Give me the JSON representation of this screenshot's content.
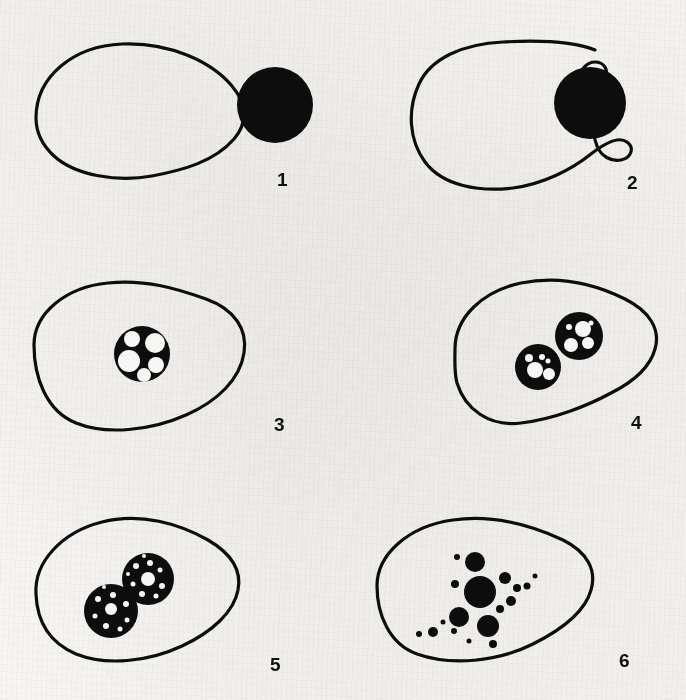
{
  "figure": {
    "medium": "scanned book page, black line art on off-white paper",
    "background_color": "#f7f6f4",
    "ink_color": "#0d0d0d",
    "width": 686,
    "height": 700,
    "layout": "2 columns x 3 rows of numbered panels"
  },
  "panels": [
    {
      "number": "1",
      "name": "panel-1-contact",
      "number_x": 277,
      "number_y": 170,
      "cell_path": "M 36 118 C 36 76, 74 46, 122 44 C 170 42, 212 62, 232 86 C 248 105, 247 124, 234 139 C 214 162, 183 170, 152 176 C 118 182, 76 176, 54 156 C 40 143, 36 131, 36 118 Z",
      "particles": [
        {
          "cx": 275,
          "cy": 105,
          "r": 38
        }
      ],
      "vacuoles": [],
      "granules": []
    },
    {
      "number": "2",
      "name": "panel-2-pseudopodia-engulfing",
      "number_x": 284,
      "number_y": 173,
      "cell_path": "M 252 50 C 232 42, 196 40, 160 42 C 120 44, 88 58, 76 84 C 64 110, 66 140, 82 162 C 100 186, 136 192, 170 188 C 200 184, 228 170, 248 154 C 262 143, 276 136, 284 142 C 292 148, 288 158, 278 160 C 268 162, 258 156, 254 146 C 248 132, 252 118, 258 110 C 244 102, 236 92, 236 80 C 236 70, 244 62, 252 62 C 261 62, 266 70, 262 77 C 259 83, 252 84, 247 80",
      "particles": [
        {
          "cx": 247,
          "cy": 103,
          "r": 36
        }
      ],
      "vacuoles": [],
      "granules": []
    },
    {
      "number": "3",
      "name": "panel-3-phagosome-formed",
      "number_x": 274,
      "number_y": 182,
      "cell_path": "M 34 112 C 34 80, 66 54, 108 50 C 146 46, 178 56, 206 66 C 234 76, 248 96, 244 120 C 240 146, 218 168, 186 182 C 150 198, 106 202, 76 190 C 46 178, 34 144, 34 112 Z",
      "vacuoles": [
        {
          "cx": 142,
          "cy": 121,
          "r": 28,
          "vesicles": [
            {
              "cx": 132,
              "cy": 106,
              "r": 8
            },
            {
              "cx": 155,
              "cy": 110,
              "r": 10
            },
            {
              "cx": 129,
              "cy": 128,
              "r": 11
            },
            {
              "cx": 156,
              "cy": 132,
              "r": 8
            },
            {
              "cx": 144,
              "cy": 142,
              "r": 7
            }
          ]
        }
      ],
      "particles": [],
      "granules": []
    },
    {
      "number": "4",
      "name": "panel-4-two-phagosomes",
      "number_x": 288,
      "number_y": 180,
      "cell_path": "M 112 116 C 112 84, 140 58, 178 50 C 218 42, 254 52, 282 66 C 306 78, 318 96, 312 116 C 306 138, 284 152, 268 160 C 246 172, 212 186, 178 190 C 146 194, 122 176, 114 150 C 111 139, 112 127, 112 116 Z",
      "vacuoles": [
        {
          "cx": 236,
          "cy": 103,
          "r": 24,
          "vesicles": [
            {
              "cx": 240,
              "cy": 96,
              "r": 8
            },
            {
              "cx": 245,
              "cy": 110,
              "r": 6
            },
            {
              "cx": 228,
              "cy": 112,
              "r": 7
            },
            {
              "cx": 226,
              "cy": 94,
              "r": 3
            },
            {
              "cx": 248,
              "cy": 90,
              "r": 2.5
            }
          ]
        },
        {
          "cx": 195,
          "cy": 134,
          "r": 23,
          "vesicles": [
            {
              "cx": 192,
              "cy": 137,
              "r": 8
            },
            {
              "cx": 206,
              "cy": 141,
              "r": 6
            },
            {
              "cx": 186,
              "cy": 125,
              "r": 4
            },
            {
              "cx": 199,
              "cy": 124,
              "r": 3
            },
            {
              "cx": 205,
              "cy": 128,
              "r": 2.5
            }
          ]
        }
      ],
      "particles": [],
      "granules": []
    },
    {
      "number": "5",
      "name": "panel-5-digestion-speckled",
      "number_x": 270,
      "number_y": 189,
      "cell_path": "M 36 128 C 34 96, 62 66, 102 56 C 140 46, 180 58, 208 74 C 232 88, 242 104, 238 124 C 234 146, 212 166, 182 180 C 148 196, 106 200, 76 188 C 48 176, 37 154, 36 128 Z",
      "vacuoles": [
        {
          "cx": 148,
          "cy": 113,
          "r": 26,
          "speckled": true,
          "vesicles": [
            {
              "cx": 148,
              "cy": 113,
              "r": 7
            },
            {
              "cx": 136,
              "cy": 100,
              "r": 3
            },
            {
              "cx": 150,
              "cy": 97,
              "r": 3
            },
            {
              "cx": 160,
              "cy": 104,
              "r": 2.5
            },
            {
              "cx": 133,
              "cy": 118,
              "r": 2.5
            },
            {
              "cx": 162,
              "cy": 120,
              "r": 3
            },
            {
              "cx": 142,
              "cy": 128,
              "r": 3
            },
            {
              "cx": 156,
              "cy": 130,
              "r": 2.5
            },
            {
              "cx": 144,
              "cy": 90,
              "r": 2
            },
            {
              "cx": 128,
              "cy": 108,
              "r": 2
            }
          ]
        },
        {
          "cx": 111,
          "cy": 145,
          "r": 27,
          "speckled": true,
          "vesicles": [
            {
              "cx": 111,
              "cy": 143,
              "r": 6
            },
            {
              "cx": 98,
              "cy": 133,
              "r": 3
            },
            {
              "cx": 113,
              "cy": 129,
              "r": 3
            },
            {
              "cx": 126,
              "cy": 138,
              "r": 3
            },
            {
              "cx": 95,
              "cy": 150,
              "r": 2.5
            },
            {
              "cx": 127,
              "cy": 154,
              "r": 2.5
            },
            {
              "cx": 106,
              "cy": 160,
              "r": 3
            },
            {
              "cx": 120,
              "cy": 163,
              "r": 2.5
            },
            {
              "cx": 104,
              "cy": 121,
              "r": 2
            }
          ]
        }
      ],
      "particles": [],
      "granules": []
    },
    {
      "number": "6",
      "name": "panel-6-residual-granules",
      "number_x": 276,
      "number_y": 185,
      "cell_path": "M 34 120 C 34 88, 66 60, 110 54 C 152 48, 190 60, 220 74 C 244 86, 254 104, 248 124 C 242 146, 218 164, 190 178 C 154 196, 108 200, 74 188 C 46 178, 34 148, 34 120 Z",
      "vacuoles": [],
      "particles": [],
      "granules": [
        {
          "cx": 137,
          "cy": 126,
          "r": 16
        },
        {
          "cx": 132,
          "cy": 96,
          "r": 10
        },
        {
          "cx": 114,
          "cy": 91,
          "r": 3
        },
        {
          "cx": 116,
          "cy": 151,
          "r": 10
        },
        {
          "cx": 145,
          "cy": 160,
          "r": 11
        },
        {
          "cx": 162,
          "cy": 112,
          "r": 6
        },
        {
          "cx": 174,
          "cy": 122,
          "r": 4
        },
        {
          "cx": 184,
          "cy": 120,
          "r": 3.5
        },
        {
          "cx": 168,
          "cy": 135,
          "r": 5
        },
        {
          "cx": 112,
          "cy": 118,
          "r": 4
        },
        {
          "cx": 157,
          "cy": 143,
          "r": 4
        },
        {
          "cx": 100,
          "cy": 156,
          "r": 2.5
        },
        {
          "cx": 90,
          "cy": 166,
          "r": 5
        },
        {
          "cx": 76,
          "cy": 168,
          "r": 3
        },
        {
          "cx": 111,
          "cy": 165,
          "r": 3
        },
        {
          "cx": 150,
          "cy": 178,
          "r": 4
        },
        {
          "cx": 192,
          "cy": 110,
          "r": 2.5
        },
        {
          "cx": 126,
          "cy": 175,
          "r": 2.5
        }
      ]
    }
  ]
}
